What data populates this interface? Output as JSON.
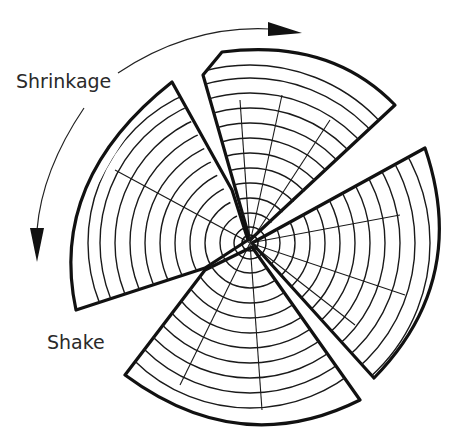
{
  "diagram": {
    "labels": {
      "shrinkage": "Shrinkage",
      "shake": "Shake"
    },
    "colors": {
      "line": "#111111",
      "text": "#2a2a2a",
      "background": "#ffffff"
    },
    "annotations": [
      {
        "id": "shrinkage-arrow",
        "direction": "circumferential",
        "description": "curved arrows indicating tangential shrinkage"
      },
      {
        "id": "shake-crack",
        "description": "radial splits from pith to bark"
      }
    ]
  }
}
